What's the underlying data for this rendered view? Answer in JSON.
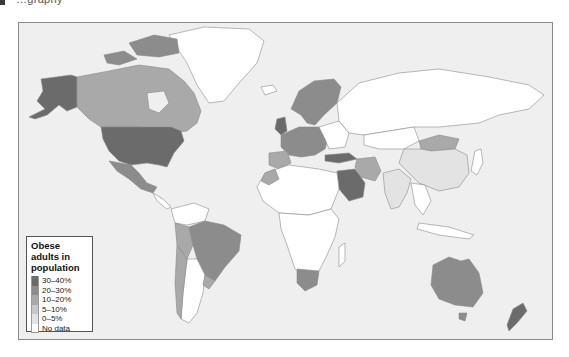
{
  "header": {
    "text": "…graphy"
  },
  "map": {
    "type": "choropleth",
    "ocean_color": "#efefef",
    "border_color": "#8a8a8a"
  },
  "legend": {
    "title": "Obese adults in population",
    "items": [
      {
        "label": "30–40%",
        "color": "#6b6b6b"
      },
      {
        "label": "20–30%",
        "color": "#8c8c8c"
      },
      {
        "label": "10–20%",
        "color": "#a9a9a9"
      },
      {
        "label": "5–10%",
        "color": "#c8c8c8"
      },
      {
        "label": "0–5%",
        "color": "#e3e3e3"
      },
      {
        "label": "No data",
        "color": "#ffffff"
      }
    ]
  },
  "regions": {
    "usa": "30–40%",
    "alaska": "30–40%",
    "saudi_arabia": "30–40%",
    "canada": "20–30%",
    "mexico": "20–30%",
    "europe_west": "20–30%",
    "turkey": "20–30%",
    "australia": "20–30%",
    "new_zealand": "20–30%",
    "south_africa": "20–30%",
    "brazil": "10–20%",
    "greenland_arctic_islands": "20–30%",
    "iran": "10–20%",
    "mongolia": "10–20%",
    "argentina": "No data",
    "china": "0–5%",
    "india": "0–5%",
    "russia": "No data",
    "africa_most": "No data",
    "greenland": "No data"
  }
}
